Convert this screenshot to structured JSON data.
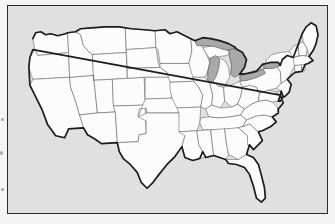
{
  "figure": {
    "kind": "outline-map",
    "projection_look": "conic",
    "has_labels": false,
    "has_legend": false,
    "frame": {
      "present": true,
      "style": "thin black rectangle",
      "color": "#2b2b2b"
    },
    "colors": {
      "page_background": "#f4f4f4",
      "map_background": "#e0e0e0",
      "state_fill": "#fcfcfc",
      "state_border": "#5d5d5d",
      "national_border": "#1d1d1d",
      "lake_fill": "#a9a9a9",
      "lake_border": "#4a4a4a",
      "scan_speck": "#8c8c8c"
    },
    "artifacts": {
      "left_margin_specks": 3,
      "description": "faint dark specks along left page edge"
    }
  },
  "map": {
    "region_name": "Contiguous United States",
    "state_count": 48,
    "includes_alaska": false,
    "includes_hawaii": false,
    "water_features": [
      "Lake Superior",
      "Lake Michigan",
      "Lake Huron",
      "Lake Erie",
      "Lake Ontario"
    ],
    "states": [
      "Washington",
      "Oregon",
      "California",
      "Nevada",
      "Idaho",
      "Montana",
      "Wyoming",
      "Utah",
      "Arizona",
      "Colorado",
      "New Mexico",
      "North Dakota",
      "South Dakota",
      "Nebraska",
      "Kansas",
      "Oklahoma",
      "Texas",
      "Minnesota",
      "Iowa",
      "Missouri",
      "Arkansas",
      "Louisiana",
      "Wisconsin",
      "Illinois",
      "Michigan",
      "Indiana",
      "Ohio",
      "Kentucky",
      "Tennessee",
      "Mississippi",
      "Alabama",
      "Georgia",
      "Florida",
      "South Carolina",
      "North Carolina",
      "Virginia",
      "West Virginia",
      "Maryland",
      "Delaware",
      "Pennsylvania",
      "New Jersey",
      "New York",
      "Connecticut",
      "Rhode Island",
      "Massachusetts",
      "Vermont",
      "New Hampshire",
      "Maine"
    ]
  }
}
